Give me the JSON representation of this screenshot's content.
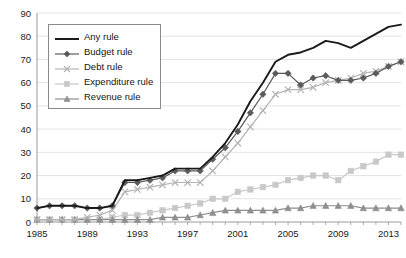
{
  "chart_data": {
    "type": "line",
    "title": "",
    "subtitle": "",
    "xlabel": "",
    "ylabel": "",
    "xlim": [
      1985,
      2014
    ],
    "ylim": [
      0,
      90
    ],
    "ytick_step": 10,
    "yticks": [
      0,
      10,
      20,
      30,
      40,
      50,
      60,
      70,
      80,
      90
    ],
    "xticks": [
      1985,
      1989,
      1993,
      1997,
      2001,
      2005,
      2009,
      2013
    ],
    "xtick_step": 4,
    "grid": true,
    "grid_axis": "y",
    "legend_position": "upper-left-inside",
    "x": [
      1985,
      1986,
      1987,
      1988,
      1989,
      1990,
      1991,
      1992,
      1993,
      1994,
      1995,
      1996,
      1997,
      1998,
      1999,
      2000,
      2001,
      2002,
      2003,
      2004,
      2005,
      2006,
      2007,
      2008,
      2009,
      2010,
      2011,
      2012,
      2013,
      2014
    ],
    "series": [
      {
        "name": "Any rule",
        "marker": "none",
        "color": "#1a1a1a",
        "values": [
          6,
          7,
          7,
          7,
          6,
          6,
          7,
          18,
          18,
          19,
          20,
          23,
          23,
          23,
          28,
          34,
          42,
          52,
          60,
          69,
          72,
          73,
          75,
          78,
          77,
          75,
          78,
          81,
          84,
          85
        ]
      },
      {
        "name": "Budget rule",
        "marker": "diamond",
        "color": "#5a5a5a",
        "values": [
          6,
          7,
          7,
          7,
          6,
          6,
          7,
          17,
          17,
          18,
          19,
          22,
          22,
          22,
          27,
          32,
          39,
          47,
          55,
          64,
          64,
          59,
          62,
          63,
          61,
          61,
          62,
          64,
          67,
          69
        ]
      },
      {
        "name": "Debt rule",
        "marker": "x",
        "color": "#b4b4b4",
        "values": [
          1,
          1,
          1,
          1,
          2,
          3,
          5,
          13,
          14,
          15,
          16,
          17,
          17,
          17,
          22,
          28,
          34,
          41,
          48,
          55,
          57,
          57,
          58,
          60,
          61,
          62,
          64,
          65,
          67,
          69
        ]
      },
      {
        "name": "Expenditure rule",
        "marker": "square",
        "color": "#c8c8c8",
        "values": [
          1,
          1,
          1,
          1,
          1,
          1,
          2,
          3,
          3,
          4,
          5,
          6,
          7,
          8,
          10,
          10,
          13,
          14,
          15,
          16,
          18,
          19,
          20,
          20,
          18,
          22,
          24,
          26,
          29,
          29
        ]
      },
      {
        "name": "Revenue rule",
        "marker": "triangle",
        "color": "#8f8f8f",
        "values": [
          1,
          1,
          1,
          1,
          1,
          1,
          1,
          1,
          1,
          1,
          2,
          2,
          2,
          3,
          4,
          5,
          5,
          5,
          5,
          5,
          6,
          6,
          7,
          7,
          7,
          7,
          6,
          6,
          6,
          6
        ]
      }
    ]
  },
  "legend": {
    "items": [
      {
        "label": "Any rule"
      },
      {
        "label": "Budget rule"
      },
      {
        "label": "Debt rule"
      },
      {
        "label": "Expenditure rule"
      },
      {
        "label": "Revenue rule"
      }
    ]
  }
}
